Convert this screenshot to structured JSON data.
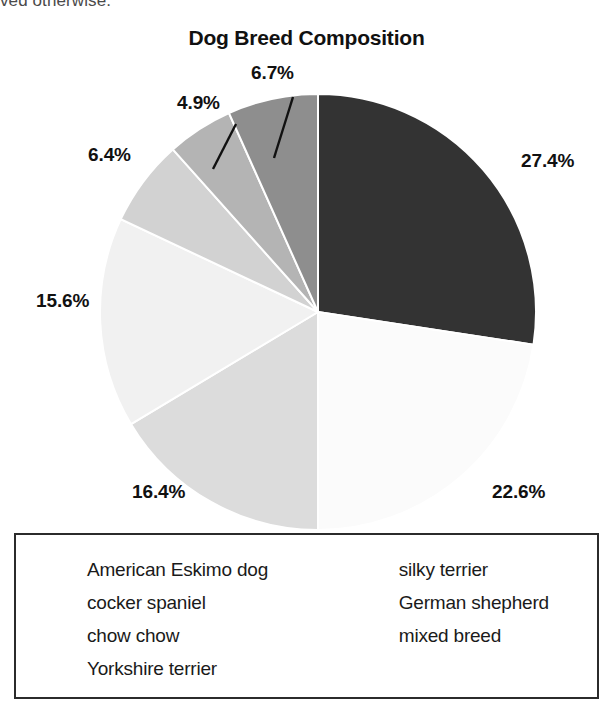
{
  "page": {
    "header_fragment": "ved otherwise."
  },
  "chart_data": {
    "type": "pie",
    "title": "Dog Breed Composition",
    "xlabel": "",
    "ylabel": "",
    "legend_position": "bottom",
    "grid": false,
    "start_angle_deg": 0,
    "direction": "clockwise",
    "categories": [
      "American Eskimo dog",
      "cocker spaniel",
      "chow chow",
      "Yorkshire terrier",
      "silky terrier",
      "German shepherd",
      "mixed breed"
    ],
    "values": [
      27.4,
      22.6,
      16.4,
      15.6,
      6.4,
      4.9,
      6.7
    ],
    "data_labels": [
      "27.4%",
      "22.6%",
      "16.4%",
      "15.6%",
      "6.4%",
      "4.9%",
      "6.7%"
    ],
    "slice_colors": [
      "#333333",
      "#fbfbfb",
      "#dcdcdc",
      "#f1f1f1",
      "#d2d2d2",
      "#b4b4b4",
      "#8e8e8e"
    ],
    "slices": [
      {
        "label": "American Eskimo dog",
        "value": 27.4,
        "pct_text": "27.4%",
        "color": "#333333"
      },
      {
        "label": "cocker spaniel",
        "value": 22.6,
        "pct_text": "22.6%",
        "color": "#fbfbfb"
      },
      {
        "label": "chow chow",
        "value": 16.4,
        "pct_text": "16.4%",
        "color": "#dcdcdc"
      },
      {
        "label": "Yorkshire terrier",
        "value": 15.6,
        "pct_text": "15.6%",
        "color": "#f1f1f1"
      },
      {
        "label": "silky terrier",
        "value": 6.4,
        "pct_text": "6.4%",
        "color": "#d2d2d2"
      },
      {
        "label": "German shepherd",
        "value": 4.9,
        "pct_text": "4.9%",
        "color": "#b4b4b4"
      },
      {
        "label": "mixed breed",
        "value": 6.7,
        "pct_text": "6.7%",
        "color": "#8e8e8e"
      }
    ]
  },
  "legend": {
    "columns": [
      {
        "items": [
          {
            "label": "American Eskimo dog",
            "color": "#333333"
          },
          {
            "label": "cocker spaniel",
            "color": "#fbfbfb"
          },
          {
            "label": "chow chow",
            "color": "#dcdcdc"
          },
          {
            "label": "Yorkshire terrier",
            "color": "#f5f5f5"
          }
        ]
      },
      {
        "items": [
          {
            "label": "silky terrier",
            "color": "#d8d8d8"
          },
          {
            "label": "German shepherd",
            "color": "#b4b4b4"
          },
          {
            "label": "mixed breed",
            "color": "#8e8e8e"
          }
        ]
      }
    ]
  }
}
